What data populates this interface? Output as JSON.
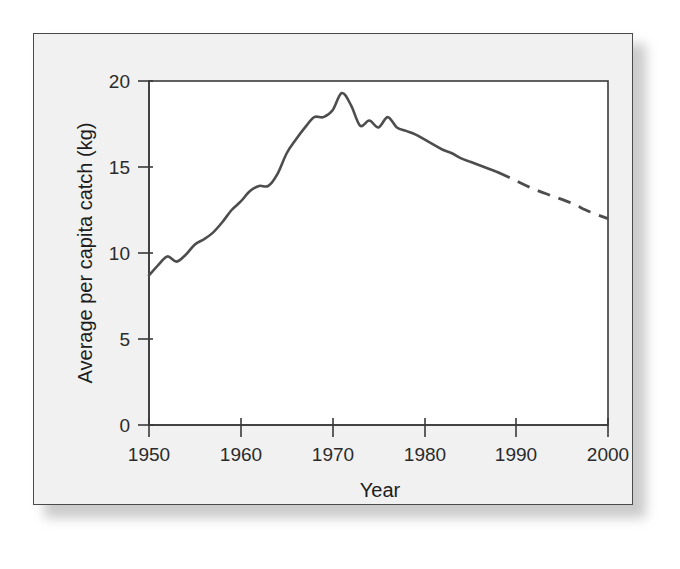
{
  "chart_data": {
    "type": "line",
    "title": "",
    "xlabel": "Year",
    "ylabel": "Average per capita catch (kg)",
    "xlim": [
      1950,
      2000
    ],
    "ylim": [
      0,
      20
    ],
    "xticks": [
      1950,
      1960,
      1970,
      1980,
      1990,
      2000
    ],
    "xtick_labels": [
      "1950",
      "1960",
      "1970",
      "1980",
      "1990",
      "2000"
    ],
    "yticks": [
      0,
      5,
      10,
      15,
      20
    ],
    "ytick_labels": [
      "0",
      "5",
      "10",
      "15",
      "20"
    ],
    "grid": false,
    "legend": false,
    "line_color": "#4d4d4d",
    "series": [
      {
        "name": "Average per capita catch (historical)",
        "style": "solid",
        "x": [
          1950,
          1951,
          1952,
          1953,
          1954,
          1955,
          1956,
          1957,
          1958,
          1959,
          1960,
          1961,
          1962,
          1963,
          1964,
          1965,
          1966,
          1967,
          1968,
          1969,
          1970,
          1971,
          1972,
          1973,
          1974,
          1975,
          1976,
          1977,
          1978,
          1979,
          1980,
          1981,
          1982,
          1983,
          1984,
          1985,
          1986,
          1987,
          1988
        ],
        "y": [
          8.7,
          9.3,
          9.8,
          9.5,
          9.9,
          10.5,
          10.8,
          11.2,
          11.8,
          12.5,
          13.0,
          13.6,
          13.9,
          13.9,
          14.6,
          15.8,
          16.6,
          17.3,
          17.9,
          17.9,
          18.3,
          19.3,
          18.6,
          17.4,
          17.7,
          17.3,
          17.9,
          17.3,
          17.1,
          16.9,
          16.6,
          16.3,
          16.0,
          15.8,
          15.5,
          15.3,
          15.1,
          14.9,
          14.7
        ]
      },
      {
        "name": "Average per capita catch (projection)",
        "style": "dashed",
        "x": [
          1988,
          1990,
          1992,
          1994,
          1996,
          1998,
          2000
        ],
        "y": [
          14.7,
          14.2,
          13.7,
          13.3,
          12.9,
          12.4,
          12.0
        ]
      }
    ],
    "annotations": [
      "Solid line shows historical record 1950-1988",
      "Dashed line shows projected decline 1988-2000"
    ]
  },
  "figure": {
    "background_color": "#f1f1f1",
    "plot_background_color": "#ffffff",
    "border_color": "#4a4a4a"
  }
}
